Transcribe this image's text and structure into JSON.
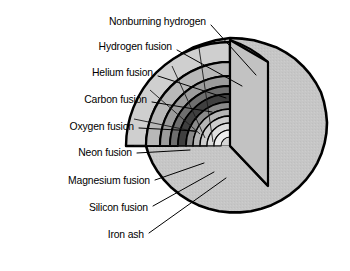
{
  "figure": {
    "background_color": "#ffffff",
    "outline_color": "#000000"
  },
  "labels": [
    {
      "id": "nonburning-hydrogen",
      "text": "Nonburning hydrogen",
      "x": 206,
      "y": 22,
      "leader": {
        "x1": 211,
        "y1": 25,
        "x2": 256,
        "y2": 75
      }
    },
    {
      "id": "hydrogen-fusion",
      "text": "Hydrogen fusion",
      "x": 172,
      "y": 47,
      "leader": {
        "x1": 177,
        "y1": 50,
        "x2": 242,
        "y2": 86
      }
    },
    {
      "id": "helium-fusion",
      "text": "Helium fusion",
      "x": 153,
      "y": 73,
      "leader": {
        "x1": 158,
        "y1": 76,
        "x2": 226,
        "y2": 98
      }
    },
    {
      "id": "carbon-fusion",
      "text": "Carbon fusion",
      "x": 147,
      "y": 100,
      "leader": {
        "x1": 152,
        "y1": 102,
        "x2": 212,
        "y2": 112
      }
    },
    {
      "id": "oxygen-fusion",
      "text": "Oxygen fusion",
      "x": 134,
      "y": 127,
      "leader": {
        "x1": 139,
        "y1": 128,
        "x2": 196,
        "y2": 131
      }
    },
    {
      "id": "neon-fusion",
      "text": "Neon fusion",
      "x": 132,
      "y": 153,
      "leader": {
        "x1": 137,
        "y1": 153,
        "x2": 190,
        "y2": 150
      }
    },
    {
      "id": "magnesium-fusion",
      "text": "Magnesium fusion",
      "x": 150,
      "y": 181,
      "leader": {
        "x1": 155,
        "y1": 180,
        "x2": 204,
        "y2": 163
      }
    },
    {
      "id": "silicon-fusion",
      "text": "Silicon fusion",
      "x": 148,
      "y": 208,
      "leader": {
        "x1": 153,
        "y1": 206,
        "x2": 214,
        "y2": 172
      }
    },
    {
      "id": "iron-ash",
      "text": "Iron ash",
      "x": 144,
      "y": 235,
      "leader": {
        "x1": 149,
        "y1": 233,
        "x2": 226,
        "y2": 178
      }
    }
  ],
  "star": {
    "center_x": 230,
    "center_y": 146,
    "outer_radius": 108,
    "surface_color": "#c6c6c6",
    "cut_face_color": "#d0d0d0",
    "shells": [
      {
        "name": "nonburning-hydrogen",
        "radius": 104,
        "color": "#c6c6c6"
      },
      {
        "name": "hydrogen-fusion",
        "radius": 84,
        "color": "#d9d9d9"
      },
      {
        "name": "helium-fusion",
        "radius": 70,
        "color": "#bdbdbd"
      },
      {
        "name": "carbon-fusion",
        "radius": 60,
        "color": "#9e9e9e"
      },
      {
        "name": "oxygen-fusion",
        "radius": 52,
        "color": "#5a5a5a"
      },
      {
        "name": "neon-fusion",
        "radius": 44,
        "color": "#8f8f8f"
      },
      {
        "name": "magnesium-fusion",
        "radius": 37,
        "color": "#c0c0c0"
      },
      {
        "name": "silicon-fusion",
        "radius": 30,
        "color": "#d4d4d4"
      },
      {
        "name": "iron-ash",
        "radius": 23,
        "color": "#e2e2e2"
      }
    ]
  }
}
